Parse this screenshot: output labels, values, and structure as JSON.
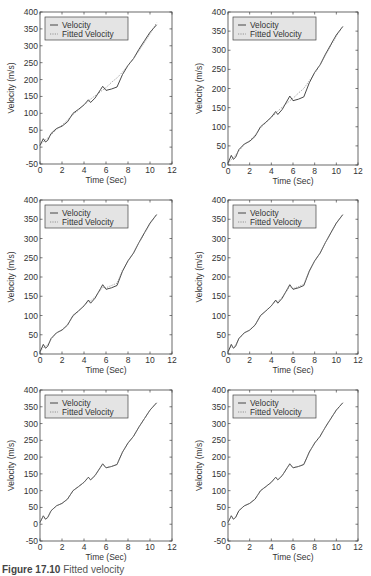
{
  "figure": {
    "caption_label": "Figure 17.10",
    "caption_text": "Fitted velocity"
  },
  "colors": {
    "velocity": "#333333",
    "fitted": "#8a8a8a",
    "legend_bg": "#e4e4e4",
    "axis": "#444444"
  },
  "chart_data": [
    {
      "type": "line",
      "panel": 1,
      "title": "",
      "xlabel": "Time (Sec)",
      "ylabel": "Velocity (m/s)",
      "xlim": [
        0,
        12
      ],
      "ylim": [
        -50,
        400
      ],
      "xticks": [
        0,
        2,
        4,
        6,
        8,
        10,
        12
      ],
      "yticks": [
        -50,
        0,
        50,
        100,
        150,
        200,
        250,
        300,
        350,
        400
      ],
      "grid": false,
      "legend": {
        "position": "upper-left",
        "entries": [
          "Velocity",
          "Fitted Velocity"
        ]
      },
      "x": [
        0,
        0.3,
        0.5,
        0.7,
        1.0,
        1.5,
        2.0,
        2.5,
        3.0,
        3.5,
        4.0,
        4.4,
        4.6,
        5.0,
        5.5,
        5.7,
        6.0,
        6.5,
        7.0,
        7.5,
        8.0,
        8.5,
        9.0,
        9.5,
        10.0,
        10.6
      ],
      "series": [
        {
          "name": "Velocity",
          "style": "solid",
          "values": [
            5,
            25,
            15,
            20,
            40,
            55,
            62,
            75,
            100,
            112,
            125,
            140,
            132,
            145,
            170,
            180,
            168,
            172,
            178,
            215,
            242,
            262,
            290,
            315,
            340,
            362
          ]
        },
        {
          "name": "Fitted Velocity",
          "style": "dotted",
          "values": [
            5,
            16,
            22,
            27,
            36,
            52,
            65,
            80,
            96,
            110,
            125,
            136,
            142,
            152,
            164,
            169,
            176,
            192,
            205,
            222,
            242,
            262,
            285,
            310,
            335,
            368
          ]
        }
      ]
    },
    {
      "type": "line",
      "panel": 2,
      "xlabel": "Time (Sec)",
      "ylabel": "Velocity (m/s)",
      "xlim": [
        0,
        12
      ],
      "ylim": [
        0,
        400
      ],
      "xticks": [
        0,
        2,
        4,
        6,
        8,
        10,
        12
      ],
      "yticks": [
        0,
        50,
        100,
        150,
        200,
        250,
        300,
        350,
        400
      ],
      "grid": false,
      "legend": {
        "position": "upper-left",
        "entries": [
          "Velocity",
          "Fitted Velocity"
        ]
      },
      "x": [
        0,
        0.3,
        0.5,
        0.7,
        1.0,
        1.5,
        2.0,
        2.5,
        3.0,
        3.5,
        4.0,
        4.4,
        4.6,
        5.0,
        5.5,
        5.7,
        6.0,
        6.5,
        7.0,
        7.5,
        8.0,
        8.5,
        9.0,
        9.5,
        10.0,
        10.6
      ],
      "series": [
        {
          "name": "Velocity",
          "style": "solid",
          "values": [
            5,
            25,
            15,
            20,
            40,
            55,
            62,
            75,
            100,
            112,
            125,
            140,
            132,
            145,
            170,
            180,
            168,
            172,
            178,
            215,
            242,
            262,
            290,
            315,
            340,
            362
          ]
        },
        {
          "name": "Fitted Velocity",
          "style": "dotted",
          "values": [
            4,
            14,
            20,
            26,
            37,
            53,
            64,
            78,
            97,
            111,
            124,
            135,
            141,
            151,
            163,
            168,
            174,
            188,
            200,
            220,
            240,
            262,
            287,
            312,
            337,
            362
          ]
        }
      ]
    },
    {
      "type": "line",
      "panel": 3,
      "xlabel": "Time (Sec)",
      "ylabel": "Velocity (m/s)",
      "xlim": [
        0,
        12
      ],
      "ylim": [
        0,
        400
      ],
      "xticks": [
        0,
        2,
        4,
        6,
        8,
        10,
        12
      ],
      "yticks": [
        0,
        50,
        100,
        150,
        200,
        250,
        300,
        350,
        400
      ],
      "grid": false,
      "legend": {
        "position": "upper-left",
        "entries": [
          "Velocity",
          "Fitted Velocity"
        ]
      },
      "x": [
        0,
        0.3,
        0.5,
        0.7,
        1.0,
        1.5,
        2.0,
        2.5,
        3.0,
        3.5,
        4.0,
        4.4,
        4.6,
        5.0,
        5.5,
        5.7,
        6.0,
        6.5,
        7.0,
        7.5,
        8.0,
        8.5,
        9.0,
        9.5,
        10.0,
        10.6
      ],
      "series": [
        {
          "name": "Velocity",
          "style": "solid",
          "values": [
            5,
            25,
            15,
            20,
            40,
            55,
            62,
            75,
            100,
            112,
            125,
            140,
            132,
            145,
            170,
            180,
            168,
            172,
            178,
            215,
            242,
            262,
            290,
            315,
            340,
            362
          ]
        },
        {
          "name": "Fitted Velocity",
          "style": "dotted",
          "values": [
            5,
            18,
            20,
            24,
            38,
            54,
            63,
            77,
            98,
            111,
            125,
            137,
            138,
            148,
            166,
            173,
            172,
            178,
            184,
            218,
            241,
            263,
            289,
            313,
            338,
            362
          ]
        }
      ]
    },
    {
      "type": "line",
      "panel": 4,
      "xlabel": "Time (Sec)",
      "ylabel": "Velocity (m/s)",
      "xlim": [
        0,
        12
      ],
      "ylim": [
        0,
        400
      ],
      "xticks": [
        0,
        2,
        4,
        6,
        8,
        10,
        12
      ],
      "yticks": [
        0,
        50,
        100,
        150,
        200,
        250,
        300,
        350,
        400
      ],
      "grid": false,
      "legend": {
        "position": "upper-left",
        "entries": [
          "Velocity",
          "Fitted Velocity"
        ]
      },
      "x": [
        0,
        0.3,
        0.5,
        0.7,
        1.0,
        1.5,
        2.0,
        2.5,
        3.0,
        3.5,
        4.0,
        4.4,
        4.6,
        5.0,
        5.5,
        5.7,
        6.0,
        6.5,
        7.0,
        7.5,
        8.0,
        8.5,
        9.0,
        9.5,
        10.0,
        10.6
      ],
      "series": [
        {
          "name": "Velocity",
          "style": "solid",
          "values": [
            5,
            25,
            15,
            20,
            40,
            55,
            62,
            75,
            100,
            112,
            125,
            140,
            132,
            145,
            170,
            180,
            168,
            172,
            178,
            215,
            242,
            262,
            290,
            315,
            340,
            362
          ]
        },
        {
          "name": "Fitted Velocity",
          "style": "dotted",
          "values": [
            5,
            20,
            18,
            22,
            39,
            55,
            62,
            76,
            99,
            112,
            125,
            138,
            136,
            147,
            167,
            175,
            170,
            175,
            181,
            216,
            241,
            262,
            290,
            314,
            339,
            362
          ]
        }
      ]
    },
    {
      "type": "line",
      "panel": 5,
      "xlabel": "Time (Sec)",
      "ylabel": "Velocity (m/s)",
      "xlim": [
        0,
        12
      ],
      "ylim": [
        -50,
        400
      ],
      "xticks": [
        0,
        2,
        4,
        6,
        8,
        10,
        12
      ],
      "yticks": [
        -50,
        0,
        50,
        100,
        150,
        200,
        250,
        300,
        350,
        400
      ],
      "grid": false,
      "legend": {
        "position": "upper-left",
        "entries": [
          "Velocity",
          "Fitted Velocity"
        ]
      },
      "x": [
        0,
        0.3,
        0.5,
        0.7,
        1.0,
        1.5,
        2.0,
        2.5,
        3.0,
        3.5,
        4.0,
        4.4,
        4.6,
        5.0,
        5.5,
        5.7,
        6.0,
        6.5,
        7.0,
        7.5,
        8.0,
        8.5,
        9.0,
        9.5,
        10.0,
        10.6
      ],
      "series": [
        {
          "name": "Velocity",
          "style": "solid",
          "values": [
            5,
            25,
            15,
            20,
            40,
            55,
            62,
            75,
            100,
            112,
            125,
            140,
            132,
            145,
            170,
            180,
            168,
            172,
            178,
            215,
            242,
            262,
            290,
            315,
            340,
            362
          ]
        },
        {
          "name": "Fitted Velocity",
          "style": "dotted",
          "values": [
            5,
            24,
            16,
            20,
            40,
            55,
            62,
            75,
            100,
            112,
            125,
            139,
            133,
            145,
            169,
            179,
            168,
            173,
            178,
            215,
            242,
            262,
            290,
            315,
            340,
            362
          ]
        }
      ]
    },
    {
      "type": "line",
      "panel": 6,
      "xlabel": "Time (Sec)",
      "ylabel": "Velocity (m/s)",
      "xlim": [
        0,
        12
      ],
      "ylim": [
        -50,
        400
      ],
      "xticks": [
        0,
        2,
        4,
        6,
        8,
        10,
        12
      ],
      "yticks": [
        -50,
        0,
        50,
        100,
        150,
        200,
        250,
        300,
        350,
        400
      ],
      "grid": false,
      "legend": {
        "position": "upper-left",
        "entries": [
          "Velocity",
          "Fitted Velocity"
        ]
      },
      "x": [
        0,
        0.3,
        0.5,
        0.7,
        1.0,
        1.5,
        2.0,
        2.5,
        3.0,
        3.5,
        4.0,
        4.4,
        4.6,
        5.0,
        5.5,
        5.7,
        6.0,
        6.5,
        7.0,
        7.5,
        8.0,
        8.5,
        9.0,
        9.5,
        10.0,
        10.6
      ],
      "series": [
        {
          "name": "Velocity",
          "style": "solid",
          "values": [
            5,
            25,
            15,
            20,
            40,
            55,
            62,
            75,
            100,
            112,
            125,
            140,
            132,
            145,
            170,
            180,
            168,
            172,
            178,
            215,
            242,
            262,
            290,
            315,
            340,
            362
          ]
        },
        {
          "name": "Fitted Velocity",
          "style": "dotted",
          "values": [
            5,
            25,
            15,
            20,
            40,
            55,
            62,
            75,
            100,
            112,
            125,
            140,
            132,
            145,
            170,
            180,
            168,
            172,
            178,
            215,
            242,
            262,
            290,
            315,
            340,
            362
          ]
        }
      ]
    }
  ],
  "layout": {
    "panels": [
      {
        "left": 40,
        "right": 172,
        "top": 12,
        "bottom": 164
      },
      {
        "left": 228,
        "right": 358,
        "top": 12,
        "bottom": 165
      },
      {
        "left": 40,
        "right": 172,
        "top": 200,
        "bottom": 354
      },
      {
        "left": 228,
        "right": 358,
        "top": 200,
        "bottom": 354
      },
      {
        "left": 40,
        "right": 172,
        "top": 390,
        "bottom": 541
      },
      {
        "left": 228,
        "right": 358,
        "top": 390,
        "bottom": 541
      }
    ]
  }
}
